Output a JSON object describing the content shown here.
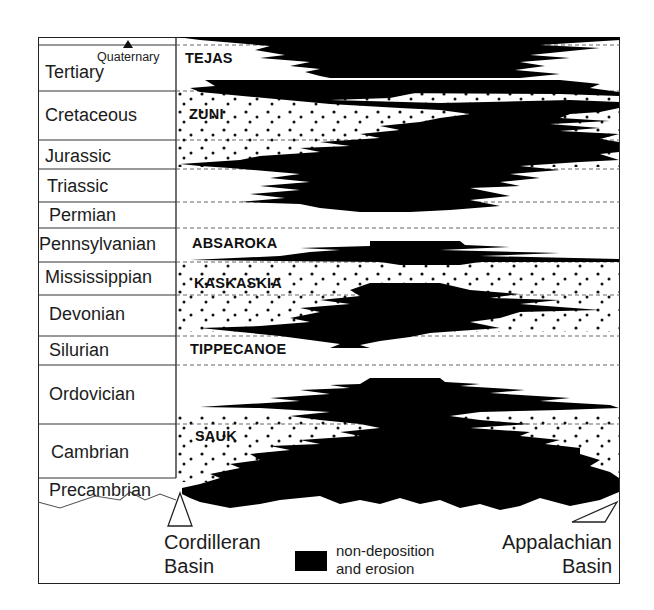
{
  "periods": [
    {
      "name": "Quaternary"
    },
    {
      "name": "Tertiary"
    },
    {
      "name": "Cretaceous"
    },
    {
      "name": "Jurassic"
    },
    {
      "name": "Triassic"
    },
    {
      "name": "Permian"
    },
    {
      "name": "Pennsylvanian"
    },
    {
      "name": "Mississippian"
    },
    {
      "name": "Devonian"
    },
    {
      "name": "Silurian"
    },
    {
      "name": "Ordovician"
    },
    {
      "name": "Cambrian"
    },
    {
      "name": "Precambrian"
    }
  ],
  "sequences": [
    "TEJAS",
    "ZUNI",
    "ABSAROKA",
    "KASKASKIA",
    "TIPPECANOE",
    "SAUK"
  ],
  "basins": {
    "left": {
      "line1": "Cordilleran",
      "line2": "Basin"
    },
    "right": {
      "line1": "Appalachian",
      "line2": "Basin"
    }
  },
  "legend": {
    "swatch_color": "#000000",
    "line1": "non-deposition",
    "line2": "and erosion"
  },
  "colors": {
    "erosion": "#000000",
    "line": "#222222",
    "background": "#ffffff"
  }
}
